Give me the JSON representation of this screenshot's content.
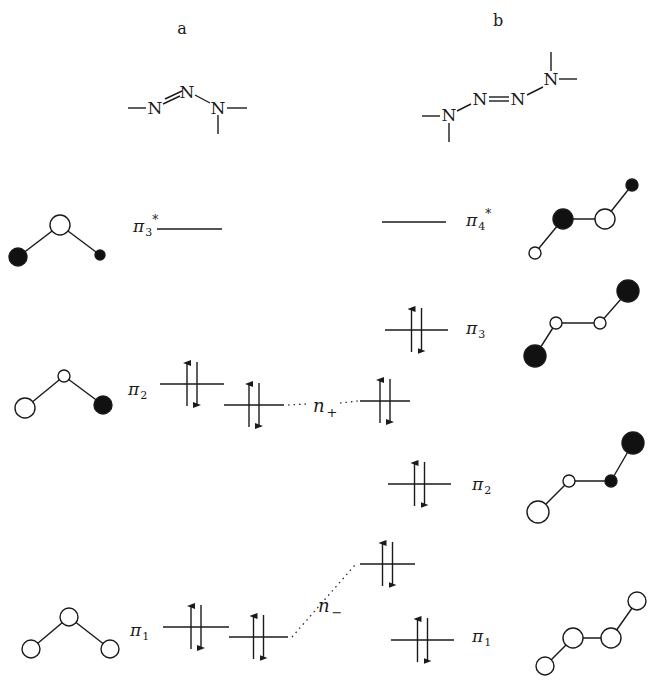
{
  "panels": {
    "a": {
      "label": "a"
    },
    "b": {
      "label": "b"
    }
  },
  "molecules": {
    "a": {
      "atoms": [
        {
          "sym": "N",
          "x": 155,
          "y": 108
        },
        {
          "sym": "N",
          "x": 187,
          "y": 92
        },
        {
          "sym": "N",
          "x": 218,
          "y": 108
        }
      ],
      "bonds": [
        [
          128,
          108,
          146,
          108
        ],
        [
          163,
          104,
          180,
          96
        ],
        [
          165,
          99,
          182,
          91
        ],
        [
          195,
          95,
          210,
          103
        ],
        [
          227,
          108,
          247,
          108
        ],
        [
          218,
          115,
          218,
          134
        ]
      ]
    },
    "b": {
      "atoms": [
        {
          "sym": "N",
          "x": 449,
          "y": 115
        },
        {
          "sym": "N",
          "x": 480,
          "y": 99
        },
        {
          "sym": "N",
          "x": 518,
          "y": 99
        },
        {
          "sym": "N",
          "x": 551,
          "y": 79
        }
      ],
      "bonds": [
        [
          422,
          116,
          440,
          116
        ],
        [
          449,
          123,
          449,
          142
        ],
        [
          457,
          111,
          471,
          104
        ],
        [
          489,
          97,
          509,
          97
        ],
        [
          489,
          101,
          509,
          101
        ],
        [
          527,
          95,
          543,
          87
        ],
        [
          551,
          52,
          551,
          71
        ],
        [
          559,
          79,
          577,
          79
        ]
      ]
    }
  },
  "levels": [
    {
      "id": "pi3star-a",
      "label": "π",
      "sub": "3",
      "sup": "*",
      "lx": 133,
      "ly": 232,
      "x1": 157,
      "x2": 222,
      "y": 229,
      "electrons": false
    },
    {
      "id": "pi4star-b",
      "label": "π",
      "sub": "4",
      "sup": "*",
      "lx": 466,
      "ly": 226,
      "x1": 382,
      "x2": 446,
      "y": 222,
      "electrons": false
    },
    {
      "id": "pi3-b",
      "label": "π",
      "sub": "3",
      "sup": "",
      "lx": 466,
      "ly": 334,
      "x1": 385,
      "x2": 448,
      "y": 330,
      "electrons": true
    },
    {
      "id": "pi2-a",
      "label": "π",
      "sub": "2",
      "sup": "",
      "lx": 128,
      "ly": 395,
      "x1": 160,
      "x2": 224,
      "y": 384,
      "electrons": true
    },
    {
      "id": "nplus-left",
      "label": "",
      "sub": "",
      "sup": "",
      "lx": 0,
      "ly": 0,
      "x1": 224,
      "x2": 284,
      "y": 405,
      "electrons": true
    },
    {
      "id": "nplus-right",
      "label": "",
      "sub": "",
      "sup": "",
      "lx": 0,
      "ly": 0,
      "x1": 360,
      "x2": 410,
      "y": 401,
      "electrons": true
    },
    {
      "id": "pi2-b",
      "label": "π",
      "sub": "2",
      "sup": "",
      "lx": 472,
      "ly": 490,
      "x1": 388,
      "x2": 451,
      "y": 484,
      "electrons": true
    },
    {
      "id": "nminus-right",
      "label": "",
      "sub": "",
      "sup": "",
      "lx": 0,
      "ly": 0,
      "x1": 360,
      "x2": 415,
      "y": 564,
      "electrons": true
    },
    {
      "id": "pi1-a",
      "label": "π",
      "sub": "1",
      "sup": "",
      "lx": 130,
      "ly": 636,
      "x1": 163,
      "x2": 229,
      "y": 627,
      "electrons": true
    },
    {
      "id": "nminus-left",
      "label": "",
      "sub": "",
      "sup": "",
      "lx": 0,
      "ly": 0,
      "x1": 229,
      "x2": 288,
      "y": 637,
      "electrons": true
    },
    {
      "id": "pi1-b",
      "label": "π",
      "sub": "1",
      "sup": "",
      "lx": 472,
      "ly": 642,
      "x1": 391,
      "x2": 454,
      "y": 640,
      "electrons": true
    }
  ],
  "correlations": [
    {
      "id": "nplus",
      "label": "n",
      "sub": "+",
      "lx": 313,
      "ly": 412,
      "segments": [
        [
          288,
          405,
          308,
          404
        ],
        [
          340,
          403,
          358,
          401
        ]
      ]
    },
    {
      "id": "nminus",
      "label": "n",
      "sub": "−",
      "lx": 318,
      "ly": 612,
      "segments": [
        [
          292,
          637,
          355,
          565
        ]
      ]
    }
  ],
  "orbitals": [
    {
      "id": "orbital-pi3star-a",
      "bonds": [
        [
          18,
          257,
          60,
          225
        ],
        [
          60,
          225,
          100,
          255
        ]
      ],
      "lobes": [
        {
          "x": 18,
          "y": 257,
          "r": 9,
          "fill": "black"
        },
        {
          "x": 60,
          "y": 225,
          "r": 10,
          "fill": "white"
        },
        {
          "x": 100,
          "y": 255,
          "r": 5,
          "fill": "black"
        }
      ]
    },
    {
      "id": "orbital-pi2-a",
      "bonds": [
        [
          25,
          408,
          64,
          376
        ],
        [
          64,
          376,
          103,
          405
        ]
      ],
      "lobes": [
        {
          "x": 25,
          "y": 408,
          "r": 10,
          "fill": "white"
        },
        {
          "x": 64,
          "y": 376,
          "r": 6,
          "fill": "white"
        },
        {
          "x": 103,
          "y": 405,
          "r": 9,
          "fill": "black"
        }
      ]
    },
    {
      "id": "orbital-pi1-a",
      "bonds": [
        [
          31,
          649,
          69,
          617
        ],
        [
          69,
          617,
          110,
          649
        ]
      ],
      "lobes": [
        {
          "x": 31,
          "y": 649,
          "r": 9,
          "fill": "white"
        },
        {
          "x": 69,
          "y": 617,
          "r": 9,
          "fill": "white"
        },
        {
          "x": 110,
          "y": 649,
          "r": 9,
          "fill": "white"
        }
      ]
    },
    {
      "id": "orbital-pi4star-b",
      "bonds": [
        [
          535,
          253,
          563,
          219
        ],
        [
          563,
          219,
          605,
          219
        ],
        [
          605,
          219,
          632,
          185
        ]
      ],
      "lobes": [
        {
          "x": 535,
          "y": 253,
          "r": 6,
          "fill": "white"
        },
        {
          "x": 563,
          "y": 219,
          "r": 10,
          "fill": "black"
        },
        {
          "x": 605,
          "y": 219,
          "r": 10,
          "fill": "white"
        },
        {
          "x": 632,
          "y": 185,
          "r": 6,
          "fill": "black"
        }
      ]
    },
    {
      "id": "orbital-pi3-b",
      "bonds": [
        [
          535,
          356,
          556,
          323
        ],
        [
          556,
          323,
          600,
          323
        ],
        [
          600,
          323,
          628,
          291
        ]
      ],
      "lobes": [
        {
          "x": 535,
          "y": 356,
          "r": 11,
          "fill": "black"
        },
        {
          "x": 556,
          "y": 323,
          "r": 6,
          "fill": "white"
        },
        {
          "x": 600,
          "y": 323,
          "r": 6,
          "fill": "white"
        },
        {
          "x": 628,
          "y": 291,
          "r": 11,
          "fill": "black"
        }
      ]
    },
    {
      "id": "orbital-pi2-b",
      "bonds": [
        [
          538,
          512,
          569,
          481
        ],
        [
          569,
          481,
          611,
          481
        ],
        [
          611,
          481,
          633,
          443
        ]
      ],
      "lobes": [
        {
          "x": 538,
          "y": 512,
          "r": 11,
          "fill": "white"
        },
        {
          "x": 569,
          "y": 481,
          "r": 6,
          "fill": "white"
        },
        {
          "x": 611,
          "y": 481,
          "r": 6,
          "fill": "black"
        },
        {
          "x": 633,
          "y": 443,
          "r": 11,
          "fill": "black"
        }
      ]
    },
    {
      "id": "orbital-pi1-b",
      "bonds": [
        [
          545,
          666,
          573,
          638
        ],
        [
          573,
          638,
          611,
          638
        ],
        [
          611,
          638,
          637,
          601
        ]
      ],
      "lobes": [
        {
          "x": 545,
          "y": 666,
          "r": 9,
          "fill": "white"
        },
        {
          "x": 573,
          "y": 638,
          "r": 10,
          "fill": "white"
        },
        {
          "x": 611,
          "y": 638,
          "r": 10,
          "fill": "white"
        },
        {
          "x": 637,
          "y": 601,
          "r": 9,
          "fill": "white"
        }
      ]
    }
  ]
}
